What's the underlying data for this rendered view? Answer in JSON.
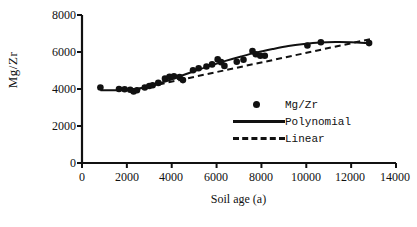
{
  "chart_data": {
    "type": "scatter",
    "title": "",
    "xlabel": "Soil age (a)",
    "ylabel": "Mg/Zr",
    "xlim": [
      0,
      14000
    ],
    "ylim": [
      0,
      8000
    ],
    "xticks": [
      0,
      2000,
      4000,
      6000,
      8000,
      10000,
      12000,
      14000
    ],
    "yticks": [
      0,
      2000,
      4000,
      6000,
      8000
    ],
    "xtick_labels": [
      "0",
      "2000",
      "4000",
      "6000",
      "8000",
      "10000",
      "12000",
      "14000"
    ],
    "ytick_labels": [
      "0",
      "2000",
      "4000",
      "6000",
      "8000"
    ],
    "grid": false,
    "legend_position": "inside bottom-right",
    "series": [
      {
        "name": "Mg/Zr",
        "type": "scatter",
        "marker": "filled-circle",
        "color": "#111111",
        "points": [
          [
            820,
            4080
          ],
          [
            1650,
            4000
          ],
          [
            1900,
            3990
          ],
          [
            2150,
            3960
          ],
          [
            2300,
            3870
          ],
          [
            2450,
            3930
          ],
          [
            2800,
            4080
          ],
          [
            3000,
            4160
          ],
          [
            3150,
            4200
          ],
          [
            3400,
            4330
          ],
          [
            3700,
            4560
          ],
          [
            3900,
            4660
          ],
          [
            4100,
            4690
          ],
          [
            4350,
            4640
          ],
          [
            4500,
            4480
          ],
          [
            4950,
            5010
          ],
          [
            5200,
            5120
          ],
          [
            5550,
            5220
          ],
          [
            5800,
            5330
          ],
          [
            6050,
            5600
          ],
          [
            6200,
            5450
          ],
          [
            6350,
            5250
          ],
          [
            6900,
            5470
          ],
          [
            7200,
            5580
          ],
          [
            7600,
            6050
          ],
          [
            7750,
            5880
          ],
          [
            7950,
            5800
          ],
          [
            8150,
            5800
          ],
          [
            10050,
            6350
          ],
          [
            10650,
            6530
          ],
          [
            12800,
            6480
          ]
        ]
      },
      {
        "name": "Polynomial",
        "type": "line",
        "style": "solid",
        "color": "#111111",
        "points": [
          [
            820,
            3930
          ],
          [
            1500,
            3935
          ],
          [
            2200,
            3970
          ],
          [
            2900,
            4110
          ],
          [
            3600,
            4370
          ],
          [
            4300,
            4660
          ],
          [
            5000,
            4960
          ],
          [
            5700,
            5250
          ],
          [
            6400,
            5520
          ],
          [
            7100,
            5760
          ],
          [
            7800,
            5980
          ],
          [
            8500,
            6160
          ],
          [
            9200,
            6320
          ],
          [
            9900,
            6430
          ],
          [
            10600,
            6510
          ],
          [
            11300,
            6540
          ],
          [
            12000,
            6530
          ],
          [
            12800,
            6480
          ]
        ]
      },
      {
        "name": "Linear",
        "type": "line",
        "style": "dashed",
        "color": "#111111",
        "points": [
          [
            2550,
            4020
          ],
          [
            12950,
            6720
          ]
        ]
      }
    ]
  },
  "axes": {
    "x_title": "Soil age (a)",
    "y_title": "Mg/Zr"
  },
  "legend": {
    "items": [
      {
        "label": "Mg/Zr",
        "symbol": "filled-circle-marker"
      },
      {
        "label": "Polynomial",
        "symbol": "solid-line"
      },
      {
        "label": "Linear",
        "symbol": "dashed-line"
      }
    ]
  },
  "colors": {
    "ink": "#111111",
    "background": "#ffffff"
  }
}
